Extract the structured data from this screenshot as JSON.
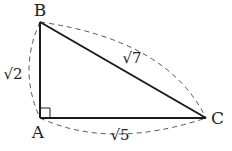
{
  "diagram": {
    "type": "right-triangle",
    "colors": {
      "stroke": "#1a1a1a",
      "dashed": "#555555",
      "text": "#222222",
      "background": "#ffffff"
    },
    "vertices": {
      "A": {
        "label": "A",
        "x": 40,
        "y": 118
      },
      "B": {
        "label": "B",
        "x": 40,
        "y": 22
      },
      "C": {
        "label": "C",
        "x": 206,
        "y": 118
      }
    },
    "right_angle_at": "A",
    "sides": {
      "AB": {
        "radicand": "2",
        "label": "√2"
      },
      "BC": {
        "radicand": "7",
        "label": "√7"
      },
      "AC": {
        "radicand": "5",
        "label": "√5"
      }
    }
  }
}
